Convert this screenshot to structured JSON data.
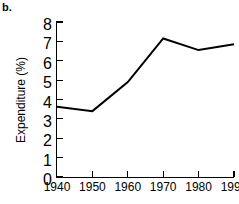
{
  "panel": {
    "label": "b."
  },
  "chart_data": {
    "type": "line",
    "title": "",
    "subtitle": "",
    "xlabel": "",
    "ylabel": "Expenditure (%)",
    "x": [
      1940,
      1950,
      1960,
      1970,
      1980,
      1990
    ],
    "values": [
      3.62,
      3.4,
      4.9,
      7.15,
      6.55,
      6.85
    ],
    "series": [
      {
        "name": "Expenditure",
        "values": [
          3.62,
          3.4,
          4.9,
          7.15,
          6.55,
          6.85
        ],
        "color": "#000000"
      }
    ],
    "xlim": [
      1940,
      1990
    ],
    "ylim": [
      0,
      8
    ],
    "xticks": [
      1940,
      1950,
      1960,
      1970,
      1980,
      1990
    ],
    "xtick_labels": [
      "1940",
      "1950",
      "1960",
      "1970",
      "1980",
      "1990"
    ],
    "yticks": [
      0,
      1,
      2,
      3,
      4,
      5,
      6,
      7,
      8
    ],
    "ytick_labels": [
      "0",
      "1",
      "2",
      "3",
      "4",
      "5",
      "6",
      "7",
      "8"
    ],
    "grid": false,
    "legend": false,
    "legend_position": "none",
    "line_color": "#000000",
    "line_width": 2,
    "markers": false,
    "annotations": []
  }
}
